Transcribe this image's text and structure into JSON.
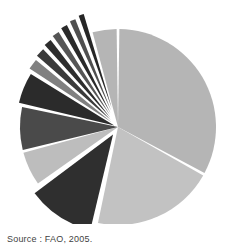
{
  "figure": {
    "source_note": "Source : FAO, 2005.",
    "background_color": "#ffffff"
  },
  "chart_data": {
    "type": "pie",
    "title": "",
    "subtitle": "",
    "xlabel": "",
    "ylabel": "",
    "legend": "none",
    "grid": false,
    "start_angle_deg": -90,
    "direction": "counterclockwise",
    "center": [
      118,
      127
    ],
    "radius": 98,
    "gap_deg": 1.6,
    "categories": [
      "Slice 1",
      "Slice 2",
      "Slice 3",
      "Slice 4",
      "Slice 5",
      "Slice 6",
      "Slice 7",
      "Slice 8",
      "Slice 9",
      "Slice 10",
      "Slice 11",
      "Slice 12",
      "Slice 13",
      "Slice 14"
    ],
    "values": [
      33.0,
      20.5,
      11.5,
      6.0,
      7.5,
      5.5,
      2.2,
      1.9,
      1.7,
      1.6,
      1.5,
      1.4,
      1.3,
      4.4
    ],
    "colors": [
      "#b5b5b5",
      "#c2c2c2",
      "#2f2f2f",
      "#bdbdbd",
      "#4a4a4a",
      "#2b2b2b",
      "#808080",
      "#3a3a3a",
      "#2d2d2d",
      "#555555",
      "#2a2a2a",
      "#4f4f4f",
      "#262626",
      "#b5b5b5"
    ],
    "exploded": [
      false,
      false,
      true,
      false,
      false,
      true,
      true,
      true,
      true,
      true,
      true,
      true,
      true,
      false
    ],
    "explode_offsets": [
      0,
      0,
      9,
      0,
      0,
      4,
      8,
      10,
      12,
      14,
      16,
      18,
      20,
      0
    ],
    "ylim": [
      0,
      100
    ]
  }
}
